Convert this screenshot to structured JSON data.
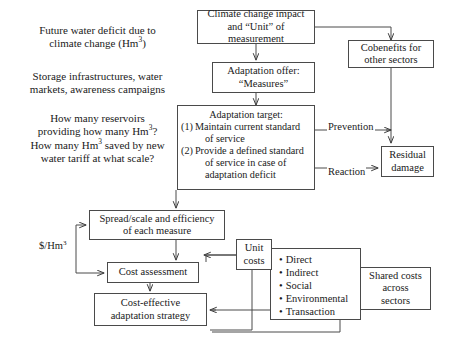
{
  "diagram": {
    "stroke_color": "#4a4a4a",
    "text_color": "#1a1a1a",
    "background": "#ffffff"
  },
  "notes": [
    {
      "id": "note-future-deficit",
      "line1": "Future water deficit due to",
      "line2_pre": "climate change (Hm",
      "line2_sup": "3",
      "line2_post": ")"
    },
    {
      "id": "note-storage",
      "line1": "Storage infrastructures, water",
      "line2": "markets, awareness campaigns"
    },
    {
      "id": "note-reservoirs",
      "line1": "How many reservoirs",
      "line2_pre": "providing how many Hm",
      "line2_sup": "3",
      "line2_post": "?",
      "line3_pre": "How many Hm",
      "line3_sup": "3",
      "line3_post": " saved by new",
      "line4": "water tariff at what scale?"
    }
  ],
  "boxes": {
    "climate_impact": {
      "line1": "Climate change impact",
      "line2": "and “Unit” of measurement"
    },
    "cobenefits": {
      "line1": "Cobenefits for",
      "line2": "other sectors"
    },
    "adaptation_offer": {
      "line1": "Adaptation offer:",
      "line2": "“Measures”"
    },
    "adaptation_target": {
      "heading": "Adaptation target:",
      "item1_num": "(1)",
      "item1_l1": "Maintain current standard",
      "item1_l2": "of service",
      "item2_num": "(2)",
      "item2_l1": "Provide a defined standard",
      "item2_l2": "of service in case of",
      "item2_l3": "adaptation deficit"
    },
    "residual_damage": {
      "line1": "Residual",
      "line2": "damage"
    },
    "spread_scale": {
      "line1": "Spread/scale and efficiency",
      "line2": "of each measure"
    },
    "cost_assessment": {
      "line1": "Cost assessment"
    },
    "cost_effective": {
      "line1": "Cost-effective",
      "line2": "adaptation strategy"
    },
    "unit_costs": {
      "line1": "Unit",
      "line2": "costs"
    },
    "cost_types": {
      "bullet": "•",
      "items": [
        "Direct",
        "Indirect",
        "Social",
        "Environmental",
        "Transaction"
      ]
    },
    "shared_costs": {
      "line1": "Shared costs",
      "line2": "across",
      "line3": "sectors"
    }
  },
  "edge_labels": {
    "prevention": "Prevention",
    "reaction": "Reaction",
    "unit_rate_pre": "$/Hm",
    "unit_rate_sup": "3"
  }
}
